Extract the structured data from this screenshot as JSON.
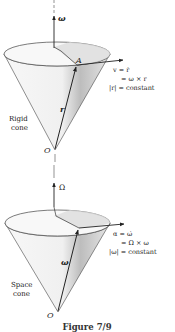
{
  "figure": {
    "caption": "Figure 7/9",
    "top_panel": {
      "axis_label": "ω",
      "point_label": "A",
      "vector_label": "r",
      "apex_label": "O",
      "cone_label_line1": "Rigid",
      "cone_label_line2": "cone",
      "equation_line1": "v = ṙ",
      "equation_line2": "= ω × r",
      "equation_line3": "|r| = constant"
    },
    "bottom_panel": {
      "axis_label": "Ω",
      "vector_label": "ω",
      "apex_label": "O",
      "cone_label_line1": "Space",
      "cone_label_line2": "cone",
      "equation_line1": "α = ω̇",
      "equation_line2": "= Ω × ω",
      "equation_line3": "|ω| = constant"
    },
    "colors": {
      "cone_fill_light": "#f2f2f2",
      "cone_fill_shade": "#c8c8c8",
      "line": "#333333"
    }
  }
}
